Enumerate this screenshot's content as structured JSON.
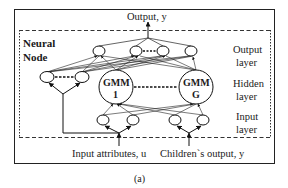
{
  "diagram": {
    "top_label": "Output, y",
    "node_title_line1": "Neural",
    "node_title_line2": "Node",
    "layers": {
      "output": [
        "Output",
        "layer"
      ],
      "hidden": [
        "Hidden",
        "layer"
      ],
      "input": [
        "Input",
        "layer"
      ]
    },
    "gmm_nodes": [
      {
        "line1": "GMM",
        "line2": "1"
      },
      {
        "line1": "GMM",
        "line2": "G"
      }
    ],
    "bottom_inputs": [
      "Input attributes, u",
      "Children`s output, y"
    ],
    "caption": "(a)"
  }
}
